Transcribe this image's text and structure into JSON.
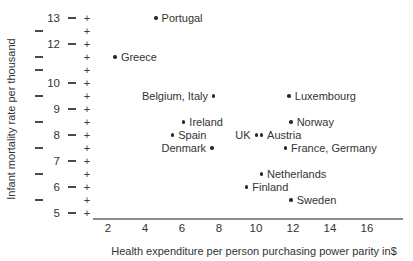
{
  "colors": {
    "text": "#333333",
    "axis_line": "#8c8c8c",
    "dot": "#2b2b2b"
  },
  "y_axis": {
    "title": "Infant mortality rate per thousand",
    "tick_labels_top_to_bottom": [
      "13",
      "",
      "12",
      "",
      "",
      "10",
      "",
      "9",
      "",
      "8",
      "",
      "7",
      "",
      "6",
      "",
      "5"
    ]
  },
  "x_axis": {
    "title": "Health expenditure per person purchasing power parity in$",
    "tick_labels": [
      "2",
      "4",
      "6",
      "8",
      "10",
      "12",
      "14",
      "16"
    ]
  },
  "chart_data": {
    "type": "scatter",
    "title": "",
    "xlabel": "Health expenditure per person purchasing power parity in$",
    "ylabel": "Infant mortality rate per thousand",
    "xlim": [
      1,
      17.5
    ],
    "x_ticks": [
      2,
      4,
      6,
      8,
      10,
      12,
      14,
      16
    ],
    "y_tick_rows_top_to_bottom": [
      13,
      12.5,
      12,
      11.5,
      11,
      10,
      9.5,
      9,
      8.5,
      8,
      7.5,
      7,
      6.5,
      6,
      5.5,
      5
    ],
    "y_axis_note": "ticks drawn as dash and plus columns; integer labels shown except 11; unlabeled rows show only a dash",
    "grid": false,
    "legend": false,
    "points": [
      {
        "label": "Portugal",
        "x": 4.6,
        "y": 13,
        "label_side": "right"
      },
      {
        "label": "Greece",
        "x": 2.4,
        "y": 11.5,
        "label_side": "right"
      },
      {
        "label": "Belgium, Italy",
        "x": 7.7,
        "y": 9.5,
        "label_side": "left"
      },
      {
        "label": "Luxembourg",
        "x": 11.8,
        "y": 9.5,
        "label_side": "right"
      },
      {
        "label": "Ireland",
        "x": 6.1,
        "y": 8.5,
        "label_side": "right"
      },
      {
        "label": "Norway",
        "x": 11.9,
        "y": 8.5,
        "label_side": "right"
      },
      {
        "label": "Spain",
        "x": 5.5,
        "y": 8,
        "label_side": "right"
      },
      {
        "label": "UK",
        "x": 10.0,
        "y": 8,
        "label_side": "left"
      },
      {
        "label": "Austria",
        "x": 10.3,
        "y": 8,
        "label_side": "right"
      },
      {
        "label": "Denmark",
        "x": 7.6,
        "y": 7.5,
        "label_side": "left"
      },
      {
        "label": "France, Germany",
        "x": 11.6,
        "y": 7.5,
        "label_side": "right"
      },
      {
        "label": "Netherlands",
        "x": 10.3,
        "y": 6.5,
        "label_side": "right"
      },
      {
        "label": "Finland",
        "x": 9.5,
        "y": 6,
        "label_side": "right"
      },
      {
        "label": "Sweden",
        "x": 11.9,
        "y": 5.5,
        "label_side": "right"
      }
    ]
  }
}
